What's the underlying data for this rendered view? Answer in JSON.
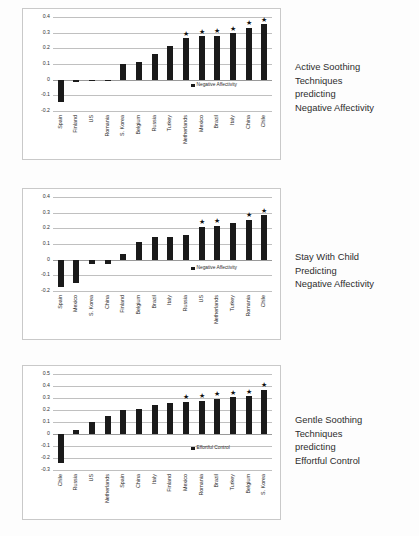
{
  "document": {
    "title": "Parenting techniques predicting temperament outcomes across countries",
    "background_color": "#fdfdfd",
    "bar_color": "#1a1a1a",
    "significance_marker": "★"
  },
  "figures": [
    {
      "id": "figure-1",
      "caption_lines": [
        "Active Soothing",
        "Techniques",
        "predicting",
        "Negative Affectivity"
      ],
      "legend": "Negative Affectivity",
      "chart_data": {
        "type": "bar",
        "title": "Active Soothing Techniques predicting Negative Affectivity",
        "xlabel": "",
        "ylabel": "",
        "ylim": [
          -0.2,
          0.4
        ],
        "yticks": [
          "0.4",
          "0.3",
          "0.2",
          "0.1",
          "0",
          "-0.1",
          "-0.2"
        ],
        "ytick_values": [
          0.4,
          0.3,
          0.2,
          0.1,
          0,
          -0.1,
          -0.2
        ],
        "grid": true,
        "legend_position": "right-inside",
        "categories": [
          "Spain",
          "Finland",
          "US",
          "Romania",
          "S. Korea",
          "Belgium",
          "Russia",
          "Turkey",
          "Netherlands",
          "Mexico",
          "Brazil",
          "Italy",
          "China",
          "Chile"
        ],
        "values": [
          -0.145,
          -0.012,
          -0.008,
          -0.008,
          0.102,
          0.115,
          0.167,
          0.218,
          0.265,
          0.277,
          0.281,
          0.297,
          0.333,
          0.355
        ],
        "significant": [
          false,
          false,
          false,
          false,
          false,
          false,
          false,
          false,
          true,
          true,
          true,
          true,
          true,
          true
        ],
        "series": [
          {
            "name": "Negative Affectivity",
            "values": [
              -0.145,
              -0.012,
              -0.008,
              -0.008,
              0.102,
              0.115,
              0.167,
              0.218,
              0.265,
              0.277,
              0.281,
              0.297,
              0.333,
              0.355
            ]
          }
        ]
      }
    },
    {
      "id": "figure-2",
      "caption_lines": [
        "Stay With Child",
        "Predicting",
        "Negative Affectivity"
      ],
      "legend": "Negative Affectivity",
      "chart_data": {
        "type": "bar",
        "title": "Stay With Child Predicting Negative Affectivity",
        "xlabel": "",
        "ylabel": "",
        "ylim": [
          -0.2,
          0.4
        ],
        "yticks": [
          "0.4",
          "0.3",
          "0.2",
          "0.1",
          "0",
          "-0.1",
          "-0.2"
        ],
        "ytick_values": [
          0.4,
          0.3,
          0.2,
          0.1,
          0,
          -0.1,
          -0.2
        ],
        "grid": true,
        "legend_position": "right-inside",
        "categories": [
          "Spain",
          "Mexico",
          "S. Korea",
          "China",
          "Finland",
          "Belgium",
          "Brazil",
          "Italy",
          "Russia",
          "US",
          "Netherlands",
          "Turkey",
          "Romania",
          "Chile"
        ],
        "values": [
          -0.175,
          -0.152,
          -0.025,
          -0.025,
          0.035,
          0.11,
          0.143,
          0.147,
          0.155,
          0.209,
          0.218,
          0.233,
          0.255,
          0.283
        ],
        "significant": [
          false,
          false,
          false,
          false,
          false,
          false,
          false,
          false,
          false,
          true,
          true,
          false,
          true,
          true
        ],
        "series": [
          {
            "name": "Negative Affectivity",
            "values": [
              -0.175,
              -0.152,
              -0.025,
              -0.025,
              0.035,
              0.11,
              0.143,
              0.147,
              0.155,
              0.209,
              0.218,
              0.233,
              0.255,
              0.283
            ]
          }
        ]
      }
    },
    {
      "id": "figure-3",
      "caption_lines": [
        "Gentle Soothing",
        "Techniques",
        "predicting",
        "Effortful Control"
      ],
      "legend": "Effortful Control",
      "chart_data": {
        "type": "bar",
        "title": "Gentle Soothing Techniques predicting Effortful Control",
        "xlabel": "",
        "ylabel": "",
        "ylim": [
          -0.3,
          0.5
        ],
        "yticks": [
          "0.5",
          "0.4",
          "0.3",
          "0.2",
          "0.1",
          "0",
          "-0.1",
          "-0.2",
          "-0.3"
        ],
        "ytick_values": [
          0.5,
          0.4,
          0.3,
          0.2,
          0.1,
          0,
          -0.1,
          -0.2,
          -0.3
        ],
        "grid": true,
        "legend_position": "right-inside",
        "categories": [
          "Chile",
          "Russia",
          "US",
          "Netherlands",
          "Spain",
          "China",
          "Italy",
          "Finland",
          "Mexico",
          "Romania",
          "Brazil",
          "Turkey",
          "Belgium",
          "S. Korea"
        ],
        "values": [
          -0.245,
          0.032,
          0.097,
          0.15,
          0.198,
          0.212,
          0.24,
          0.255,
          0.27,
          0.277,
          0.295,
          0.305,
          0.313,
          0.367
        ],
        "significant": [
          false,
          false,
          false,
          false,
          false,
          false,
          false,
          false,
          true,
          true,
          true,
          true,
          true,
          true
        ],
        "series": [
          {
            "name": "Effortful Control",
            "values": [
              -0.245,
              0.032,
              0.097,
              0.15,
              0.198,
              0.212,
              0.24,
              0.255,
              0.27,
              0.277,
              0.295,
              0.305,
              0.313,
              0.367
            ]
          }
        ]
      }
    }
  ]
}
